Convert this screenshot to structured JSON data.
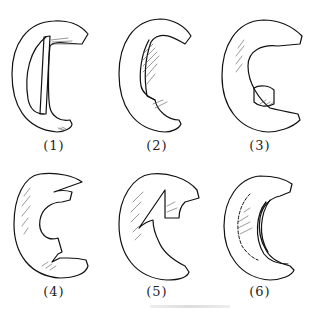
{
  "figure": {
    "panels": [
      {
        "label": "(1)",
        "depicts": "ear outline with vertical cartilage strip"
      },
      {
        "label": "(2)",
        "depicts": "ear with shaded concha hollow"
      },
      {
        "label": "(3)",
        "depicts": "ear with small cartilage block in lower helix"
      },
      {
        "label": "(4)",
        "depicts": "ear with notch in lower inner contour"
      },
      {
        "label": "(5)",
        "depicts": "ear with triangular wedge cut at upper inner contour"
      },
      {
        "label": "(6)",
        "depicts": "ear with dashed incision line and layered inner rim"
      }
    ],
    "colors": {
      "ink": "#111111",
      "background": "#ffffff"
    }
  }
}
